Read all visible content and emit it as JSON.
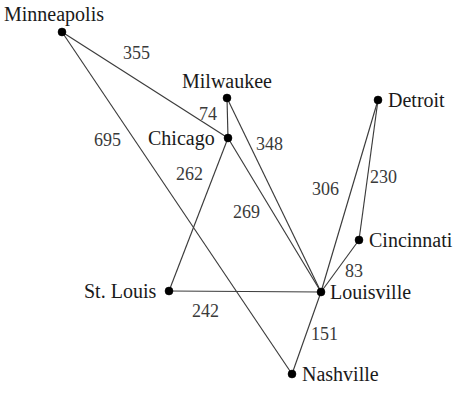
{
  "diagram": {
    "type": "weighted-undirected-graph",
    "title": "",
    "width": 469,
    "height": 398,
    "background_color": "#ffffff",
    "node_color": "#000000",
    "edge_color": "#3b3b3b",
    "label_color": "#1a1a1a",
    "weight_color": "#3a3a3a",
    "nodes": [
      {
        "id": "minneapolis",
        "label": "Minneapolis",
        "x": 62,
        "y": 32,
        "label_x": 4,
        "label_y": 4,
        "label_anchor": "above-left"
      },
      {
        "id": "milwaukee",
        "label": "Milwaukee",
        "x": 227,
        "y": 98,
        "label_x": 182,
        "label_y": 71,
        "label_anchor": "above"
      },
      {
        "id": "chicago",
        "label": "Chicago",
        "x": 228,
        "y": 138,
        "label_x": 148,
        "label_y": 128,
        "label_anchor": "left"
      },
      {
        "id": "detroit",
        "label": "Detroit",
        "x": 378,
        "y": 100,
        "label_x": 388,
        "label_y": 90,
        "label_anchor": "right"
      },
      {
        "id": "cincinnati",
        "label": "Cincinnati",
        "x": 359,
        "y": 240,
        "label_x": 369,
        "label_y": 230,
        "label_anchor": "right"
      },
      {
        "id": "louisville",
        "label": "Louisville",
        "x": 321,
        "y": 292,
        "label_x": 330,
        "label_y": 282,
        "label_anchor": "right"
      },
      {
        "id": "stlouis",
        "label": "St. Louis",
        "x": 169,
        "y": 291,
        "label_x": 84,
        "label_y": 281,
        "label_anchor": "left"
      },
      {
        "id": "nashville",
        "label": "Nashville",
        "x": 292,
        "y": 374,
        "label_x": 302,
        "label_y": 364,
        "label_anchor": "right"
      }
    ],
    "edges": [
      {
        "id": "minneapolis-chicago",
        "from": "minneapolis",
        "to": "chicago",
        "weight": "355",
        "weight_x": 123,
        "weight_y": 44
      },
      {
        "id": "minneapolis-nashville",
        "from": "minneapolis",
        "to": "nashville",
        "weight": "695",
        "weight_x": 94,
        "weight_y": 131
      },
      {
        "id": "milwaukee-chicago",
        "from": "milwaukee",
        "to": "chicago",
        "weight": "74",
        "weight_x": 199,
        "weight_y": 105
      },
      {
        "id": "milwaukee-louisville",
        "from": "milwaukee",
        "to": "louisville",
        "weight": "348",
        "weight_x": 256,
        "weight_y": 135
      },
      {
        "id": "chicago-louisville",
        "from": "chicago",
        "to": "louisville",
        "weight": "269",
        "weight_x": 233,
        "weight_y": 203
      },
      {
        "id": "chicago-stlouis",
        "from": "chicago",
        "to": "stlouis",
        "weight": "262",
        "weight_x": 176,
        "weight_y": 165
      },
      {
        "id": "detroit-louisville",
        "from": "detroit",
        "to": "louisville",
        "weight": "306",
        "weight_x": 312,
        "weight_y": 180
      },
      {
        "id": "detroit-cincinnati",
        "from": "detroit",
        "to": "cincinnati",
        "weight": "230",
        "weight_x": 370,
        "weight_y": 168
      },
      {
        "id": "cincinnati-louisville",
        "from": "cincinnati",
        "to": "louisville",
        "weight": "83",
        "weight_x": 345,
        "weight_y": 262
      },
      {
        "id": "stlouis-louisville",
        "from": "stlouis",
        "to": "louisville",
        "weight": "242",
        "weight_x": 192,
        "weight_y": 302
      },
      {
        "id": "louisville-nashville",
        "from": "louisville",
        "to": "nashville",
        "weight": "151",
        "weight_x": 311,
        "weight_y": 325
      }
    ]
  }
}
